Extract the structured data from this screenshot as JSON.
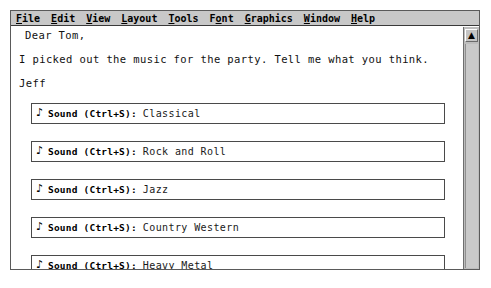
{
  "window": {
    "menu": {
      "items": [
        {
          "label": "File",
          "accel": "F"
        },
        {
          "label": "Edit",
          "accel": "E"
        },
        {
          "label": "View",
          "accel": "V"
        },
        {
          "label": "Layout",
          "accel": "L"
        },
        {
          "label": "Tools",
          "accel": "T"
        },
        {
          "label": "Font",
          "accel": "o"
        },
        {
          "label": "Graphics",
          "accel": "G"
        },
        {
          "label": "Window",
          "accel": "W"
        },
        {
          "label": "Help",
          "accel": "H"
        }
      ]
    },
    "document": {
      "lines": [
        "Dear Tom,",
        "I picked out the music for the party. Tell me what you think.",
        "Jeff"
      ],
      "sound_objects": [
        {
          "icon": "music-note-icon",
          "label": "Sound (Ctrl+S):",
          "value": "Classical"
        },
        {
          "icon": "music-note-icon",
          "label": "Sound (Ctrl+S):",
          "value": "Rock and Roll"
        },
        {
          "icon": "music-note-icon",
          "label": "Sound (Ctrl+S):",
          "value": "Jazz"
        },
        {
          "icon": "music-note-icon",
          "label": "Sound (Ctrl+S):",
          "value": "Country Western"
        },
        {
          "icon": "music-note-icon",
          "label": "Sound (Ctrl+S):",
          "value": "Heavy Metal"
        }
      ]
    },
    "scrollbar": {
      "up_arrow": "▲",
      "icon": "scroll-up-arrow-icon"
    }
  },
  "colors": {
    "menu_bar": "#c8c8c8",
    "window_frame": "#5a5a5a",
    "scrollbar_track": "#bdbdbd",
    "page": "#ffffff",
    "text": "#111111"
  },
  "glyphs": {
    "music_note": "♪"
  }
}
